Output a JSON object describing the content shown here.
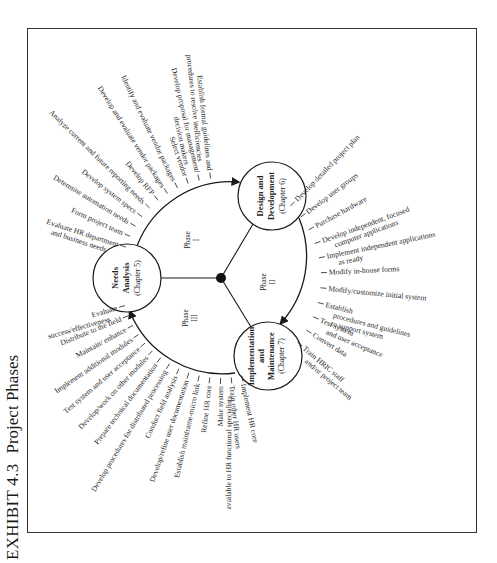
{
  "exhibit": {
    "number": "EXHIBIT 4.3",
    "title": "Project Phases"
  },
  "hubs": {
    "needs_analysis": {
      "line1": "Needs",
      "line2": "Analysis",
      "chapter": "(Chapter 5)"
    },
    "design_development": {
      "line1": "Design and",
      "line2": "Development",
      "chapter": "(Chapter 6)"
    },
    "implementation_maintenance": {
      "line1": "Implementation",
      "line2": "and",
      "line3": "Maintenance",
      "chapter": "(Chapter 7)"
    }
  },
  "phases": {
    "phase1": {
      "word": "Phase",
      "numeral": "I"
    },
    "phase2": {
      "word": "Phase",
      "numeral": "II"
    },
    "phase3": {
      "word": "Phase",
      "numeral": "III"
    }
  },
  "phase1_tasks": [
    [
      "Evaluate HR department",
      "and business needs"
    ],
    [
      "Form project team"
    ],
    [
      "Determine automation needs"
    ],
    [
      "Develop system specs"
    ],
    [
      "Analyze current and future reporting needs"
    ],
    [
      "Develop RFP"
    ],
    [
      "Develop and evaluate vendor packages"
    ],
    [
      "Identify and evaluate vendor packages"
    ],
    [
      "Select vendor"
    ],
    [
      "Develop proposal for management/",
      "decision makers"
    ],
    [
      "Establish formal guidelines and",
      "procedures to resolve inefficiencies"
    ]
  ],
  "phase2_tasks": [
    [
      "Develop detailed project plan"
    ],
    [
      "Develop user groups"
    ],
    [
      "Purchase hardware"
    ],
    [
      "Develop independent, focused",
      "computer applications"
    ],
    [
      "Implement independent applications",
      "as ready"
    ],
    [
      "Modify in-house forms"
    ],
    [
      "Modify/customize initial system"
    ],
    [
      "Establish",
      "procedures and guidelines",
      "to support system"
    ],
    [
      "Test system",
      "and user acceptance"
    ],
    [
      "Convert data"
    ],
    [
      "Train HRIC staff",
      "and/or project team"
    ]
  ],
  "phase3_tasks": [
    [
      "Implement HR core"
    ],
    [
      "Train other HR users"
    ],
    [
      "Make system",
      "available to HR functional specialists"
    ],
    [
      "Refine HR core"
    ],
    [
      "Establish mainframe-micro link"
    ],
    [
      "Develop/refine user documentation"
    ],
    [
      "Conduct field analysis"
    ],
    [
      "Develop procedures for distributed processing"
    ],
    [
      "Prepare technical documentation"
    ],
    [
      "Develop/work on other modules"
    ],
    [
      "Test system and user acceptance"
    ],
    [
      "Implement additional modules"
    ],
    [
      "Maintain/ enhance"
    ],
    [
      "Distribute to the field"
    ],
    [
      "Evaluate",
      "success/effectiveness"
    ]
  ]
}
